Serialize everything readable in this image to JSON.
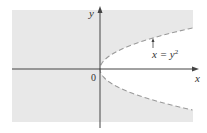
{
  "figure": {
    "x_axis_label": "x",
    "y_axis_label": "y",
    "origin_label": "0",
    "curve_label_lhs": "x = y",
    "curve_label_exp": "2",
    "curve_equation": "x = y^2",
    "region": "excluded interior of parabola x = y^2 (region shaded outside)",
    "colors": {
      "shade": "#e8e8e8",
      "axis": "#444444",
      "curve": "#999999"
    }
  }
}
